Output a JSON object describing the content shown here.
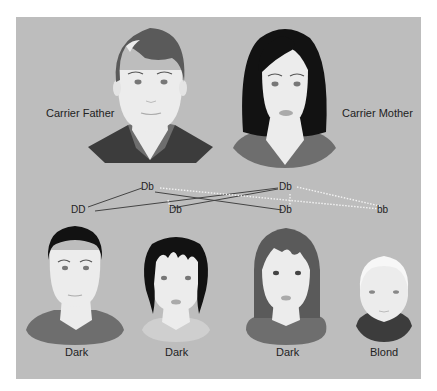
{
  "parents": {
    "father": {
      "label": "Carrier Father",
      "genotype": "Db"
    },
    "mother": {
      "label": "Carrier Mother",
      "genotype": "Db"
    }
  },
  "offspring_genotypes": [
    "DD",
    "Db",
    "Db",
    "bb"
  ],
  "children": [
    {
      "label": "Dark",
      "hair": "dark"
    },
    {
      "label": "Dark",
      "hair": "dark"
    },
    {
      "label": "Dark",
      "hair": "dark"
    },
    {
      "label": "Blond",
      "hair": "blond"
    }
  ],
  "colors": {
    "background": "#bdbdbd",
    "skin": "#ececec",
    "hair_black": "#121212",
    "hair_gray": "#5a5a5a",
    "shirt_dark": "#3c3c3c",
    "shirt_mid": "#6e6e6e",
    "line_dominant": "#444444",
    "line_recessive": "#f2f2f2"
  }
}
